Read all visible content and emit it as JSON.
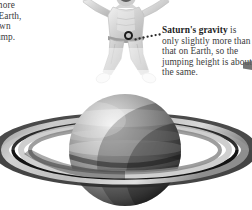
{
  "page": {
    "background_color": "#ffffff",
    "width": 252,
    "height": 210
  },
  "left_callout": {
    "name": "left-gravity-note",
    "cropped": true,
    "lines": [
      "ity is more",
      "hat of Earth,",
      "ack down",
      "mall jump."
    ],
    "text_color": "#3a3a3a"
  },
  "right_callout": {
    "name": "saturn-gravity-note",
    "heading": "Saturn's gravity",
    "body": " is only slightly more than that on Earth, so the jumping height is about the same.",
    "lines": [
      "Saturn's gravity",
      "is only slightly",
      "more than that",
      "on Earth, so the",
      "jumping height",
      "is about the same."
    ],
    "heading_color": "#232323",
    "body_color": "#3d3d3d"
  },
  "leader": {
    "marker_icon": "circle-outline-icon",
    "line_icon": "dotted-leader-line-icon",
    "color": "#1c1c1c",
    "dot_count": 7
  },
  "jumper": {
    "name": "jumping-person-photo",
    "description": "Person mid-jump with arms and legs spread, faded grayscale, head cropped at top",
    "tone": "#cfcfcf"
  },
  "saturn": {
    "name": "saturn-planet-illustration",
    "description": "Grayscale Saturn with ring system, cropped at bottom edge",
    "body_highlight": "#e8e8e8",
    "body_mid": "#8f8f8f",
    "body_shadow": "#2f2f2f",
    "ring_bright": "#d8d8d8",
    "ring_dark": "#1e1e1e",
    "cassini_division": "#141414"
  },
  "edge_mark": {
    "name": "clipped-edge-arrow",
    "color": "#5a5a5a"
  }
}
